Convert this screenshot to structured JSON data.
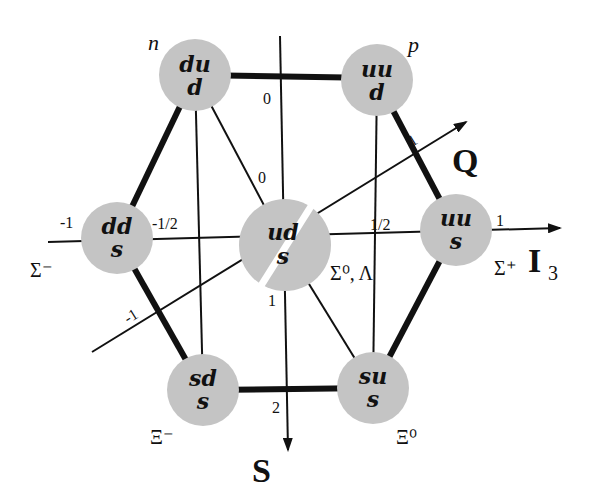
{
  "diagram": {
    "axes": {
      "i3": {
        "label": "I",
        "subscript": "3",
        "ticks": [
          "-1",
          "-1/2",
          "1/2",
          "1"
        ]
      },
      "s": {
        "label": "S",
        "ticks": [
          "0",
          "1",
          "2"
        ]
      },
      "q": {
        "label": "Q",
        "ticks": [
          "-1",
          "0",
          "1"
        ]
      }
    },
    "nodes": [
      {
        "id": "n",
        "top": "du",
        "bottom": "d",
        "name": "n"
      },
      {
        "id": "p",
        "top": "uu",
        "bottom": "d",
        "name": "p"
      },
      {
        "id": "sigma-minus",
        "top": "dd",
        "bottom": "s",
        "name": "Σ⁻"
      },
      {
        "id": "sigma0-lambda",
        "top": "ud",
        "bottom": "s",
        "name": "Σ⁰, Λ"
      },
      {
        "id": "sigma-plus",
        "top": "uu",
        "bottom": "s",
        "name": "Σ⁺"
      },
      {
        "id": "xi-minus",
        "top": "sd",
        "bottom": "s",
        "name": "Ξ⁻"
      },
      {
        "id": "xi-zero",
        "top": "su",
        "bottom": "s",
        "name": "Ξ⁰"
      }
    ],
    "colors": {
      "node_fill": "#c4c4c4",
      "line": "#111111",
      "background": "#ffffff"
    }
  }
}
